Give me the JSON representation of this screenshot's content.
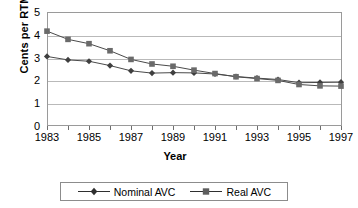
{
  "chart_data": {
    "type": "line",
    "title": "",
    "xlabel": "Year",
    "ylabel": "Cents per RTM",
    "x": [
      1983,
      1984,
      1985,
      1986,
      1987,
      1988,
      1989,
      1990,
      1991,
      1992,
      1993,
      1994,
      1995,
      1996,
      1997
    ],
    "xlim": [
      1983,
      1997
    ],
    "ylim": [
      0,
      5
    ],
    "yticks": [
      0,
      1,
      2,
      3,
      4,
      5
    ],
    "ytick_labels": [
      "0",
      "1",
      "2",
      "3",
      "4",
      "5"
    ],
    "xtick_labels": [
      "1983",
      "",
      "1985",
      "",
      "1987",
      "",
      "1989",
      "",
      "1991",
      "",
      "1993",
      "",
      "1995",
      "",
      "1997"
    ],
    "grid": "horizontal",
    "legend_position": "bottom",
    "series": [
      {
        "name": "Nominal AVC",
        "marker": "diamond",
        "color": "#3f3f3f",
        "values": [
          3.05,
          2.9,
          2.84,
          2.65,
          2.42,
          2.32,
          2.34,
          2.33,
          2.28,
          2.17,
          2.1,
          2.04,
          1.9,
          1.91,
          1.92
        ]
      },
      {
        "name": "Real AVC",
        "marker": "square",
        "color": "#6a6a6a",
        "values": [
          4.16,
          3.8,
          3.61,
          3.3,
          2.92,
          2.72,
          2.62,
          2.45,
          2.3,
          2.16,
          2.08,
          2.0,
          1.82,
          1.76,
          1.75
        ]
      }
    ]
  },
  "axes": {
    "y_title": "Cents per RTM",
    "x_title": "Year"
  },
  "legend": {
    "items": [
      {
        "label": "Nominal AVC"
      },
      {
        "label": "Real AVC"
      }
    ]
  }
}
